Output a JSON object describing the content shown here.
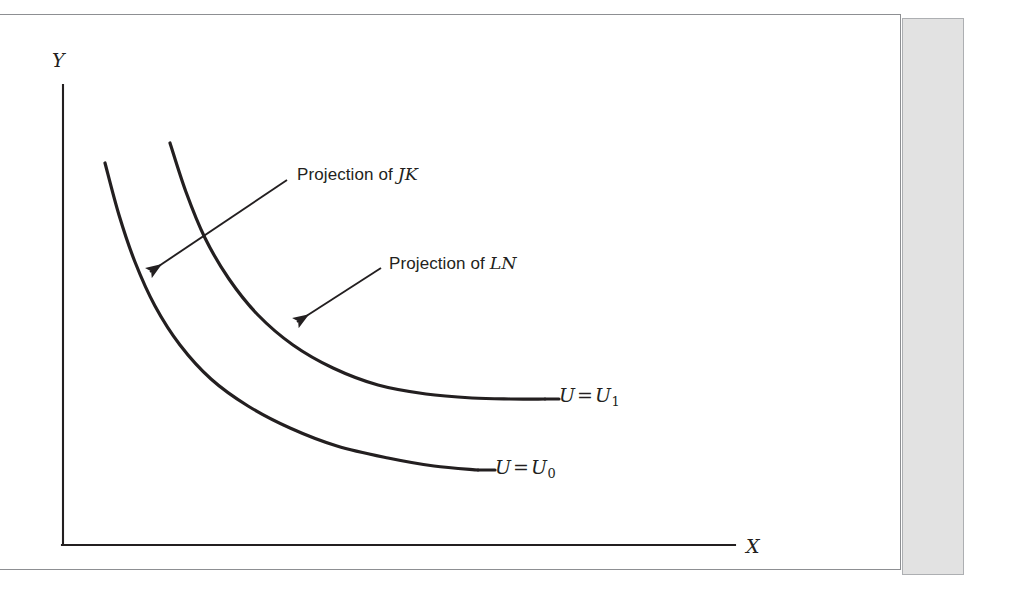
{
  "figure": {
    "kind": "economics-indifference-curve-diagram",
    "background_color": "#ffffff",
    "frame_border_color": "#8d8f92",
    "gutter_band_color": "#e2e2e2",
    "ink_color": "#231f20"
  },
  "axes": {
    "y_label": "Y",
    "x_label": "X"
  },
  "callouts": [
    {
      "id": "jk",
      "prefix": "Projection of ",
      "emphasis": "JK",
      "arrow_from": [
        287,
        180
      ],
      "arrow_to": [
        150,
        272
      ],
      "points_at": "U0-curve"
    },
    {
      "id": "ln",
      "prefix": "Projection of ",
      "emphasis": "LN",
      "arrow_from": [
        381,
        268
      ],
      "arrow_to": [
        297,
        322
      ],
      "points_at": "U1-curve"
    }
  ],
  "curve_labels": [
    {
      "id": "u1",
      "lhs": "U",
      "relation": "=",
      "rhs": "U",
      "subscript": "1"
    },
    {
      "id": "u0",
      "lhs": "U",
      "relation": "=",
      "rhs": "U",
      "subscript": "0"
    }
  ],
  "chart_data": {
    "type": "line",
    "title": "",
    "xlabel": "X",
    "ylabel": "Y",
    "grid": false,
    "legend": "inline-right-endpoint",
    "axis_origin_px": [
      63,
      545
    ],
    "x_axis_end_px": [
      735,
      545
    ],
    "y_axis_top_px": [
      63,
      85
    ],
    "series": [
      {
        "name": "U = U0",
        "label": "U = U₀",
        "stroke": "#231f20",
        "stroke_width": 3.2,
        "points_px": [
          [
            105,
            163
          ],
          [
            119,
            215
          ],
          [
            135,
            262
          ],
          [
            155,
            306
          ],
          [
            180,
            345
          ],
          [
            211,
            379
          ],
          [
            248,
            406
          ],
          [
            290,
            428
          ],
          [
            337,
            446
          ],
          [
            388,
            458
          ],
          [
            434,
            466
          ],
          [
            478,
            470
          ]
        ],
        "label_anchor_px": [
          495,
          470
        ]
      },
      {
        "name": "U = U1",
        "label": "U = U₁",
        "stroke": "#231f20",
        "stroke_width": 3.2,
        "points_px": [
          [
            170,
            143
          ],
          [
            186,
            192
          ],
          [
            205,
            238
          ],
          [
            229,
            279
          ],
          [
            258,
            315
          ],
          [
            293,
            345
          ],
          [
            333,
            368
          ],
          [
            378,
            385
          ],
          [
            426,
            394
          ],
          [
            472,
            398
          ],
          [
            510,
            399
          ],
          [
            545,
            399
          ]
        ],
        "label_anchor_px": [
          559,
          398
        ]
      }
    ]
  }
}
